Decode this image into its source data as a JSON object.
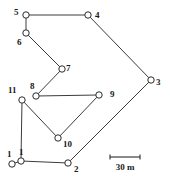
{
  "figure": {
    "kind": "survey-traverse-diagram",
    "width": 170,
    "height": 180,
    "background_color": "#ffffff",
    "line_color": "#3c3c3c",
    "node_fill_color": "#ffffff",
    "node_stroke_color": "#2b2b2b",
    "label_color": "#1a1a1a"
  },
  "nodes": [
    {
      "id": "n1a",
      "label": "1",
      "cx": 12,
      "cy": 164,
      "r": 3.2,
      "label_x": 7,
      "label_y": 150
    },
    {
      "id": "n1b",
      "label": "1",
      "cx": 21,
      "cy": 161,
      "r": 3.2,
      "label_x": 19,
      "label_y": 148
    },
    {
      "id": "n2",
      "label": "2",
      "cx": 68,
      "cy": 163,
      "r": 3.2,
      "label_x": 74,
      "label_y": 165
    },
    {
      "id": "n3",
      "label": "3",
      "cx": 151,
      "cy": 80,
      "r": 3.2,
      "label_x": 156,
      "label_y": 78
    },
    {
      "id": "n4",
      "label": "4",
      "cx": 88,
      "cy": 15,
      "r": 3.2,
      "label_x": 95,
      "label_y": 11
    },
    {
      "id": "n5",
      "label": "5",
      "cx": 26,
      "cy": 15,
      "r": 3.2,
      "label_x": 14,
      "label_y": 8
    },
    {
      "id": "n6",
      "label": "6",
      "cx": 26,
      "cy": 33,
      "r": 3.2,
      "label_x": 17,
      "label_y": 38
    },
    {
      "id": "n7",
      "label": "7",
      "cx": 62,
      "cy": 69,
      "r": 3.2,
      "label_x": 66,
      "label_y": 64
    },
    {
      "id": "n8",
      "label": "8",
      "cx": 36,
      "cy": 96,
      "r": 3.2,
      "label_x": 30,
      "label_y": 82
    },
    {
      "id": "n9",
      "label": "9",
      "cx": 99,
      "cy": 95,
      "r": 3.2,
      "label_x": 110,
      "label_y": 90
    },
    {
      "id": "n10",
      "label": "10",
      "cx": 58,
      "cy": 138,
      "r": 3.2,
      "label_x": 63,
      "label_y": 140
    },
    {
      "id": "n11",
      "label": "11",
      "cx": 22,
      "cy": 100,
      "r": 3.2,
      "label_x": 8,
      "label_y": 86
    }
  ],
  "edges": [
    {
      "id": "e-5-4",
      "from": "n5",
      "to": "n4"
    },
    {
      "id": "e-4-3",
      "from": "n4",
      "to": "n3"
    },
    {
      "id": "e-3-2",
      "from": "n3",
      "to": "n2"
    },
    {
      "id": "e-2-1b",
      "from": "n2",
      "to": "n1b"
    },
    {
      "id": "e-1b-1a",
      "from": "n1b",
      "to": "n1a"
    },
    {
      "id": "e-1b-11",
      "from": "n1b",
      "to": "n11"
    },
    {
      "id": "e-5-6",
      "from": "n5",
      "to": "n6"
    },
    {
      "id": "e-6-7",
      "from": "n6",
      "to": "n7"
    },
    {
      "id": "e-7-8",
      "from": "n7",
      "to": "n8"
    },
    {
      "id": "e-8-9",
      "from": "n8",
      "to": "n9"
    },
    {
      "id": "e-9-10",
      "from": "n9",
      "to": "n10"
    },
    {
      "id": "e-10-11",
      "from": "n10",
      "to": "n11"
    }
  ],
  "scale_bar": {
    "label": "30 m",
    "x1": 110,
    "x2": 140,
    "y": 157,
    "tick_height": 5,
    "caption_x": 110,
    "caption_y": 163,
    "caption_width": 30
  }
}
